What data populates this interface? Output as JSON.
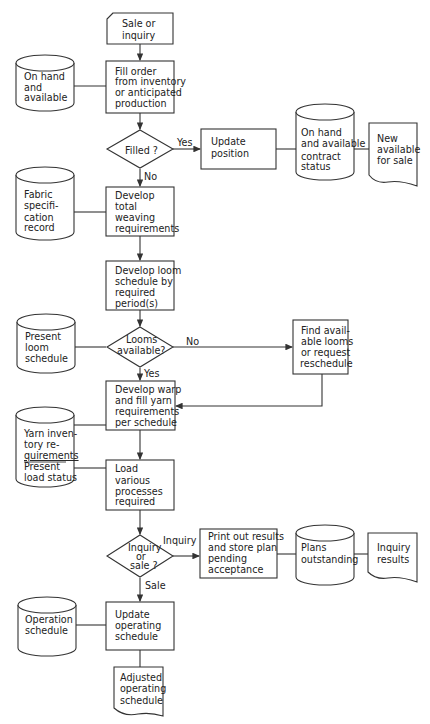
{
  "diagram": {
    "type": "flowchart",
    "nodes": {
      "sale_or_inquiry": {
        "shape": "card",
        "lines": [
          "Sale or",
          "inquiry"
        ]
      },
      "fill_order": {
        "shape": "process",
        "lines": [
          "Fill  order",
          "from inventory",
          "or anticipated",
          "production"
        ]
      },
      "on_hand_available": {
        "shape": "storage",
        "lines": [
          "On hand",
          "and",
          "available"
        ]
      },
      "filled_decision": {
        "shape": "decision",
        "lines": [
          "Filled ?"
        ]
      },
      "update_position": {
        "shape": "process",
        "lines": [
          "Update",
          "position"
        ]
      },
      "contract_status": {
        "shape": "storage",
        "lines": [
          "On hand",
          "and available",
          "contract",
          "status"
        ]
      },
      "new_available": {
        "shape": "document",
        "lines": [
          "New",
          "available",
          "for sale"
        ]
      },
      "fabric_spec": {
        "shape": "storage",
        "lines": [
          "Fabric",
          "specifi-",
          "cation",
          "record"
        ]
      },
      "weaving_req": {
        "shape": "process",
        "lines": [
          "Develop",
          "total",
          "weaving",
          "requirements"
        ]
      },
      "loom_schedule": {
        "shape": "process",
        "lines": [
          "Develop loom",
          "schedule by",
          "required",
          "period(s)"
        ]
      },
      "present_loom": {
        "shape": "storage",
        "lines": [
          "Present",
          "loom",
          "schedule"
        ]
      },
      "looms_decision": {
        "shape": "decision",
        "lines": [
          "Looms",
          "available?"
        ]
      },
      "find_looms": {
        "shape": "process",
        "lines": [
          "Find avail-",
          "able looms",
          "or request",
          "reschedule"
        ]
      },
      "warp_fill": {
        "shape": "process",
        "lines": [
          "Develop warp",
          "and fill yarn",
          "requirements",
          "per schedule"
        ]
      },
      "yarn_inventory": {
        "shape": "storage",
        "lines": [
          "Yarn inven-",
          "tory re-",
          "quirements",
          "Present",
          "load status"
        ]
      },
      "load_processes": {
        "shape": "process",
        "lines": [
          "Load",
          "various",
          "processes",
          "required"
        ]
      },
      "inquiry_decision": {
        "shape": "decision",
        "lines": [
          "Inquiry",
          "or",
          "sale ?"
        ]
      },
      "print_results": {
        "shape": "process",
        "lines": [
          "Print out results",
          "and store plan",
          "pending",
          "acceptance"
        ]
      },
      "plans_outstanding": {
        "shape": "storage",
        "lines": [
          "Plans",
          "outstanding"
        ]
      },
      "inquiry_results": {
        "shape": "document",
        "lines": [
          "Inquiry",
          "results"
        ]
      },
      "operation_schedule": {
        "shape": "storage",
        "lines": [
          "Operation",
          "schedule"
        ]
      },
      "update_operating": {
        "shape": "process",
        "lines": [
          "Update",
          "operating",
          "schedule"
        ]
      },
      "adjusted_operating": {
        "shape": "document",
        "lines": [
          "Adjusted",
          "operating",
          "schedule"
        ]
      }
    },
    "edge_labels": {
      "filled_yes": "Yes",
      "filled_no": "No",
      "looms_no": "No",
      "looms_yes": "Yes",
      "inquiry": "Inquiry",
      "sale": "Sale"
    },
    "colors": {
      "line": "#333333",
      "text": "#222222",
      "background": "#ffffff"
    }
  }
}
